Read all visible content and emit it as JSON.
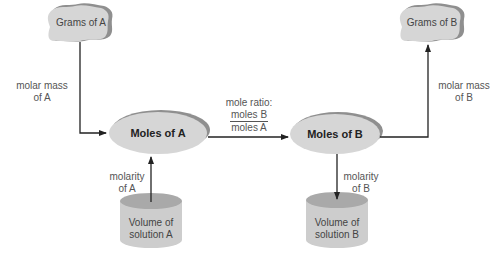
{
  "diagram": {
    "nodes": {
      "grams_a": {
        "label": "Grams of A",
        "shape": "rock"
      },
      "grams_b": {
        "label": "Grams of B",
        "shape": "rock"
      },
      "moles_a": {
        "label": "Moles of A",
        "shape": "ellipse"
      },
      "moles_b": {
        "label": "Moles of B",
        "shape": "ellipse"
      },
      "volume_a": {
        "line1": "Volume of",
        "line2": "solution A",
        "shape": "cylinder"
      },
      "volume_b": {
        "line1": "Volume of",
        "line2": "solution B",
        "shape": "cylinder"
      }
    },
    "edges": {
      "grams_a_to_moles_a": {
        "line1": "molar mass",
        "line2": "of A"
      },
      "moles_a_to_moles_b": {
        "title": "mole ratio:",
        "numerator": "moles B",
        "denominator": "moles A"
      },
      "moles_b_to_grams_b": {
        "line1": "molar mass",
        "line2": "of B"
      },
      "volume_a_to_moles_a": {
        "line1": "molarity",
        "line2": "of A"
      },
      "moles_b_to_volume_b": {
        "line1": "molarity",
        "line2": "of B"
      }
    },
    "colors": {
      "node_fill": "#d6d6d6",
      "node_shadow": "#8f8f8f",
      "line": "#222222",
      "text": "#555555"
    }
  }
}
